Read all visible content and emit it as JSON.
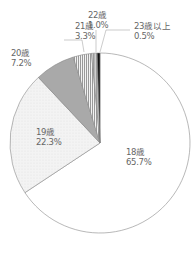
{
  "chart_data": {
    "type": "pie",
    "title": "",
    "categories": [
      "18歳",
      "19歳",
      "20歳",
      "21歳",
      "22歳",
      "23歳以上"
    ],
    "values": [
      65.7,
      22.3,
      7.2,
      3.3,
      1.0,
      0.5
    ],
    "units": "%",
    "labels": [
      {
        "name": "18歳",
        "value": "65.7%"
      },
      {
        "name": "19歳",
        "value": "22.3%"
      },
      {
        "name": "20歳",
        "value": "7.2%"
      },
      {
        "name": "21歳",
        "value": "3.3%"
      },
      {
        "name": "22歳",
        "value": "1.0%"
      },
      {
        "name": "23歳以上",
        "value": "0.5%"
      }
    ],
    "start_angle": "12 o'clock, counter-clockwise",
    "legend": "none (direct labels)"
  }
}
